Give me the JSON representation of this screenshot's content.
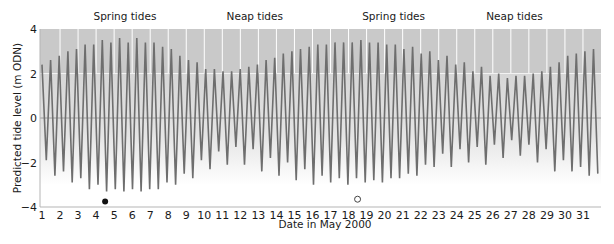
{
  "chart_data": {
    "type": "line",
    "title": "",
    "xlabel": "Date in May 2000",
    "ylabel": "Predicted tide level (m ODN)",
    "xlim": [
      1,
      32
    ],
    "ylim": [
      -4,
      4
    ],
    "yticks": [
      4,
      2,
      0,
      -2,
      -4
    ],
    "yticklabels": [
      "4",
      "2",
      "0",
      "−2",
      "−4"
    ],
    "xticks": [
      1,
      2,
      3,
      4,
      5,
      6,
      7,
      8,
      9,
      10,
      11,
      12,
      13,
      14,
      15,
      16,
      17,
      18,
      19,
      20,
      21,
      22,
      23,
      24,
      25,
      26,
      27,
      28,
      29,
      30,
      31
    ],
    "xticklabels": [
      "1",
      "2",
      "3",
      "4",
      "5",
      "6",
      "7",
      "8",
      "9",
      "10",
      "11",
      "12",
      "13",
      "14",
      "15",
      "16",
      "17",
      "18",
      "19",
      "20",
      "21",
      "22",
      "23",
      "24",
      "25",
      "26",
      "27",
      "28",
      "29",
      "30",
      "31"
    ],
    "grid": {
      "vertical_white_lines_top_band": true,
      "horizontal_lines": [
        2,
        0
      ]
    },
    "phase_labels": [
      {
        "text": "Spring tides",
        "x": 5.6
      },
      {
        "text": "Neap tides",
        "x": 12.8
      },
      {
        "text": "Spring tides",
        "x": 20.5
      },
      {
        "text": "Neap tides",
        "x": 27.2
      }
    ],
    "markers": [
      {
        "type": "filled-circle",
        "meaning": "new-moon",
        "x": 4.5,
        "y": -3.75
      },
      {
        "type": "open-circle",
        "meaning": "full-moon",
        "x": 18.5,
        "y": -3.65
      }
    ],
    "series": [
      {
        "name": "Predicted tide level",
        "color": "#6e6e6e",
        "high_tides": [
          2.4,
          2.6,
          2.8,
          3.0,
          3.1,
          3.3,
          3.3,
          3.5,
          3.4,
          3.6,
          3.4,
          3.6,
          3.4,
          3.4,
          3.2,
          3.1,
          2.8,
          2.6,
          2.5,
          2.2,
          2.2,
          2.1,
          2.1,
          2.2,
          2.3,
          2.4,
          2.6,
          2.7,
          2.9,
          3.0,
          3.1,
          3.2,
          3.3,
          3.3,
          3.4,
          3.4,
          3.4,
          3.5,
          3.4,
          3.4,
          3.3,
          3.3,
          3.1,
          3.2,
          2.9,
          3.0,
          2.6,
          2.8,
          2.4,
          2.5,
          2.1,
          2.3,
          1.9,
          2.0,
          1.8,
          1.9,
          1.9,
          2.0,
          2.1,
          2.3,
          2.5,
          2.8,
          2.9,
          3.0,
          3.1
        ],
        "low_tides": [
          -1.9,
          -2.6,
          -2.4,
          -2.9,
          -2.7,
          -3.2,
          -3.0,
          -3.3,
          -3.2,
          -3.3,
          -3.2,
          -3.3,
          -3.2,
          -3.2,
          -2.9,
          -3.0,
          -2.5,
          -2.7,
          -1.9,
          -2.3,
          -1.5,
          -2.1,
          -1.3,
          -2.1,
          -1.4,
          -2.4,
          -1.8,
          -2.6,
          -2.0,
          -2.8,
          -2.3,
          -3.0,
          -2.6,
          -2.9,
          -2.7,
          -3.0,
          -2.7,
          -2.9,
          -2.8,
          -2.9,
          -2.7,
          -2.7,
          -2.5,
          -2.6,
          -2.1,
          -2.2,
          -1.6,
          -2.2,
          -1.4,
          -2.0,
          -1.3,
          -2.1,
          -1.2,
          -1.8,
          -1.0,
          -1.7,
          -1.2,
          -2.0,
          -1.4,
          -2.4,
          -1.9,
          -2.4,
          -2.2,
          -2.6,
          -2.5
        ]
      }
    ],
    "background": {
      "top_band_color": "#c9c9c9",
      "gradient_top_color": "#d6d6d6",
      "gradient_bottom_color": "#ffffff"
    }
  }
}
